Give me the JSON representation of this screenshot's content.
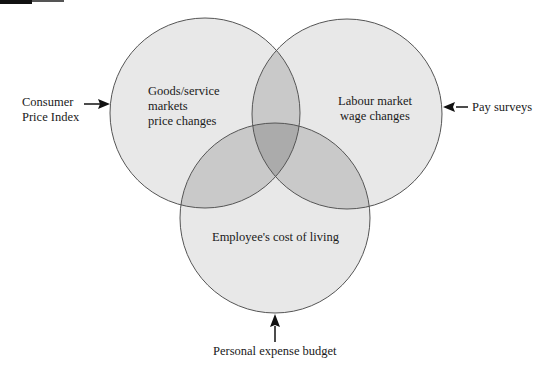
{
  "diagram": {
    "type": "venn",
    "circles": [
      {
        "id": "goods",
        "label_lines": [
          "Goods/service",
          "markets",
          "price changes"
        ],
        "cx": 205,
        "cy": 113,
        "r": 95
      },
      {
        "id": "labour",
        "label_lines": [
          "Labour market",
          "wage changes"
        ],
        "cx": 347,
        "cy": 114,
        "r": 95
      },
      {
        "id": "living",
        "label_lines": [
          "Employee's cost of living"
        ],
        "cx": 275,
        "cy": 218,
        "r": 95
      }
    ],
    "inputs": [
      {
        "id": "cpi",
        "label_lines": [
          "Consumer",
          "Price Index"
        ],
        "target": "goods",
        "direction": "right"
      },
      {
        "id": "pay",
        "label_lines": [
          "Pay surveys"
        ],
        "target": "labour",
        "direction": "left"
      },
      {
        "id": "budget",
        "label_lines": [
          "Personal expense budget"
        ],
        "target": "living",
        "direction": "up"
      }
    ],
    "colors": {
      "fill": "#e6e6e6",
      "overlap2": "#c8c8c8",
      "overlap3": "#a9a9a9",
      "stroke": "#555555"
    }
  }
}
